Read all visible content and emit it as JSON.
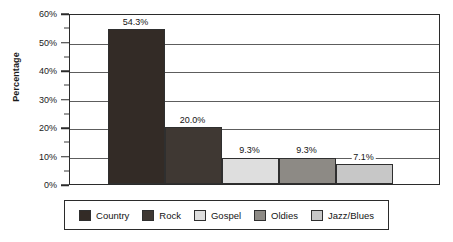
{
  "chart_data": {
    "type": "bar",
    "title": "",
    "subtitle": "",
    "xlabel": "",
    "ylabel": "Percentage",
    "categories": [
      "Country",
      "Rock",
      "Gospel",
      "Oldies",
      "Jazz/Blues"
    ],
    "values": [
      54.3,
      20.0,
      9.3,
      9.3,
      7.1
    ],
    "data_labels": [
      "54.3%",
      "20.0%",
      "9.3%",
      "9.3%",
      "7.1%"
    ],
    "ylim": [
      0,
      60
    ],
    "y_ticks": [
      0,
      10,
      20,
      30,
      40,
      50,
      60
    ],
    "y_tick_labels": [
      "0%",
      "10%",
      "20%",
      "30%",
      "40%",
      "50%",
      "60%"
    ],
    "y_minor_ticks": [
      5,
      15,
      25,
      35,
      45,
      55
    ],
    "grid": true,
    "grid_axis": "y",
    "legend": true,
    "legend_position": "bottom",
    "legend_entries": [
      {
        "label": "Country",
        "color": "#332b26"
      },
      {
        "label": "Rock",
        "color": "#3f3833"
      },
      {
        "label": "Gospel",
        "color": "#dedede"
      },
      {
        "label": "Oldies",
        "color": "#8d8a85"
      },
      {
        "label": "Jazz/Blues",
        "color": "#c7c7c7"
      }
    ],
    "bar_colors": [
      "#332b26",
      "#3f3833",
      "#dedede",
      "#8d8a85",
      "#c7c7c7"
    ],
    "bars_contiguous": true,
    "axis_color": "#2b2b2b",
    "grid_color": "#5d5d5d",
    "background": "#ffffff"
  }
}
